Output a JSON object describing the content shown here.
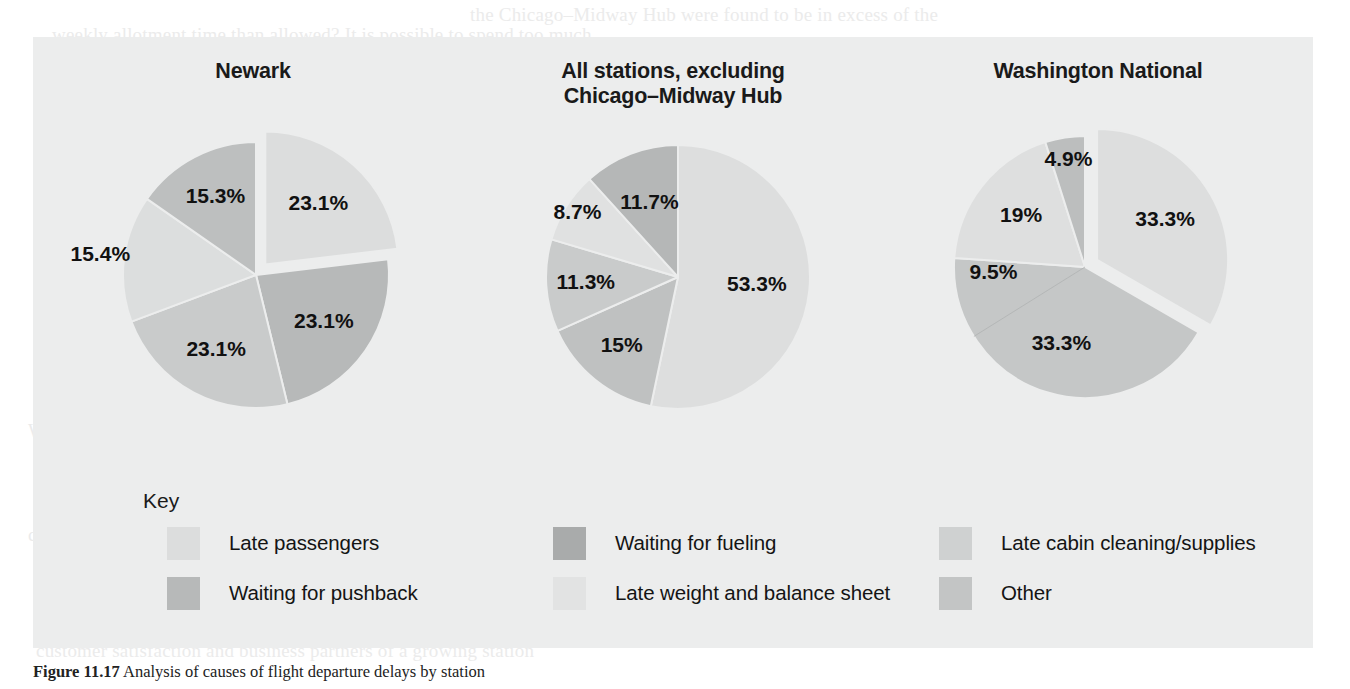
{
  "figure": {
    "caption_label": "Figure 11.17",
    "caption_text": "Analysis of causes of flight departure delays by station",
    "panel_bg": "#eceded"
  },
  "palette": {
    "late_passengers": "#dcdddd",
    "waiting_for_pushback": "#b7b9b9",
    "waiting_for_fueling": "#a9abab",
    "late_weight_and_balance_sheet": "#e2e3e3",
    "late_cabin_cleaning_supplies": "#cfd1d1",
    "other": "#c3c5c5"
  },
  "key": {
    "title": "Key",
    "items": [
      {
        "label": "Late passengers",
        "color_key": "late_passengers",
        "col": 0,
        "row": 0
      },
      {
        "label": "Waiting for pushback",
        "color_key": "waiting_for_pushback",
        "col": 0,
        "row": 1
      },
      {
        "label": "Waiting for fueling",
        "color_key": "waiting_for_fueling",
        "col": 1,
        "row": 0
      },
      {
        "label": "Late weight and balance sheet",
        "color_key": "late_weight_and_balance_sheet",
        "col": 1,
        "row": 1
      },
      {
        "label": "Late cabin cleaning/supplies",
        "color_key": "late_cabin_cleaning_supplies",
        "col": 2,
        "row": 0
      },
      {
        "label": "Other",
        "color_key": "other",
        "col": 2,
        "row": 1
      }
    ]
  },
  "chart_data": [
    {
      "type": "pie",
      "title": "Newark",
      "title_line1": "Newark",
      "title_line2": "",
      "start_angle": 0,
      "exploded_index": 0,
      "categories": [
        "Late passengers",
        "Waiting for pushback",
        "Waiting for fueling",
        "Late weight and balance sheet",
        "Other"
      ],
      "values": [
        23.1,
        23.1,
        23.1,
        15.4,
        15.3
      ],
      "labels": [
        "23.1%",
        "23.1%",
        "23.1%",
        "15.4%",
        "15.3%"
      ],
      "colors": [
        "#dcdddd",
        "#b7b9b9",
        "#c9cbcb",
        "#dcdede",
        "#bdbfbf"
      ],
      "label_radius": [
        0.6,
        0.62,
        0.64,
        1.18,
        0.66
      ],
      "units": "percent"
    },
    {
      "type": "pie",
      "title": "All stations, excluding Chicago–Midway Hub",
      "title_line1": "All stations, excluding",
      "title_line2": "Chicago–Midway Hub",
      "start_angle": 0,
      "exploded_index": -1,
      "categories": [
        "Late passengers",
        "Waiting for pushback",
        "Waiting for fueling",
        "Late weight and balance sheet",
        "Other"
      ],
      "values": [
        53.3,
        15.0,
        11.3,
        8.7,
        11.7
      ],
      "labels": [
        "53.3%",
        "15%",
        "11.3%",
        "8.7%",
        "11.7%"
      ],
      "colors": [
        "#dddede",
        "#bfc1c1",
        "#c9cbcb",
        "#e0e1e1",
        "#b5b7b7"
      ],
      "label_radius": [
        0.6,
        0.68,
        0.7,
        0.9,
        0.6
      ],
      "units": "percent"
    },
    {
      "type": "pie",
      "title": "Washington National",
      "title_line1": "Washington National",
      "title_line2": "",
      "start_angle": 0,
      "exploded_index": 0,
      "categories": [
        "Late passengers",
        "Waiting for pushback",
        "Late weight and balance sheet",
        "Other"
      ],
      "values": [
        33.3,
        42.8,
        19.0,
        4.9
      ],
      "labels": [
        "33.3%",
        "33.3%",
        "19%",
        "4.9%"
      ],
      "label_values": [
        33.3,
        33.3,
        19.0,
        4.9
      ],
      "secondary_label": "9.5%",
      "colors": [
        "#dddede",
        "#c5c7c7",
        "#dedfdf",
        "#bcbebe"
      ],
      "label_radius": [
        0.6,
        0.62,
        0.62,
        0.82
      ],
      "units": "percent"
    }
  ],
  "ghost_text": [
    {
      "text": "the Chicago–Midway Hub were found to be in excess of the",
      "x": 470,
      "y": 4
    },
    {
      "text": "weekly allotment time than allowed? It is possible to spend too much",
      "x": 52,
      "y": 24
    },
    {
      "text": "on quality; extraneous expenditures are not warranted. Second",
      "x": 80,
      "y": 50
    },
    {
      "text": "experienced at a given station must be justified for the model to make",
      "x": 66,
      "y": 74
    },
    {
      "text": "in particular, on the direct impact on the ROI. Finally, the quality",
      "x": 88,
      "y": 100
    },
    {
      "text": "improvement efforts away from being centralized.",
      "x": 92,
      "y": 124
    },
    {
      "text": "improvement program.",
      "x": 92,
      "y": 150
    },
    {
      "text": "To determine the feasibility of the small flight time window, one",
      "x": 90,
      "y": 232
    },
    {
      "text": "small flight time window related to the overall delay; the improvement",
      "x": 60,
      "y": 258
    },
    {
      "text": "with the nonstandard or inefficient procedures being performed",
      "x": 72,
      "y": 284
    },
    {
      "text": "observe the current customer base and, there, the goal becomes the",
      "x": 62,
      "y": 310
    },
    {
      "text": "it so that the delegation to the one will be generated.",
      "x": 86,
      "y": 336
    },
    {
      "text": "With good documentation it is sometimes possible for a firm to correct a",
      "x": 28,
      "y": 420
    },
    {
      "text": "problem at the root cause. Once the root cause is identified and corrected a",
      "x": 34,
      "y": 446
    },
    {
      "text": "it is necessary to revise the standard operating procedures.",
      "x": 40,
      "y": 472
    },
    {
      "text": "As in the case that data can be modeled, standard deviations with the",
      "x": 34,
      "y": 498
    },
    {
      "text": "customer immediately; satisfy customers with quality procedures through",
      "x": 28,
      "y": 524
    },
    {
      "text": "customer satisfaction and business partners of a growing station",
      "x": 36,
      "y": 640
    }
  ]
}
